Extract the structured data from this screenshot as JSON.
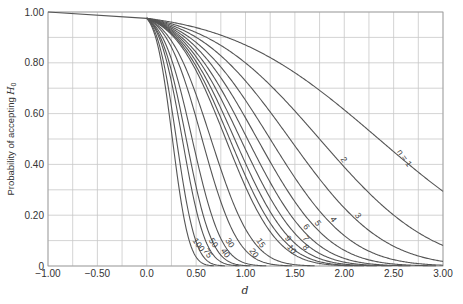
{
  "chart_data": {
    "type": "line",
    "title": "",
    "xlabel": "d",
    "ylabel": "Probability of accepting H0",
    "xlim": [
      -1.0,
      3.0
    ],
    "ylim": [
      0,
      1.0
    ],
    "grid": true,
    "x_ticks": [
      "-1.00",
      "-0.50",
      "0.0",
      "0.50",
      "1.00",
      "1.50",
      "2.00",
      "2.50",
      "3.00"
    ],
    "y_ticks": [
      "0",
      "0.20",
      "0.40",
      "0.60",
      "0.80",
      "1.00"
    ],
    "x_minor_step": 0.25,
    "y_minor_step": 0.1,
    "common_segment": {
      "x": [
        -1.0,
        0.0
      ],
      "y": [
        1.0,
        0.975
      ]
    },
    "x": [
      0,
      0.5,
      1.0,
      1.5,
      2.0,
      2.5,
      3.0
    ],
    "series": [
      {
        "name": "n = 1",
        "label": "n = 1",
        "d50": 2.35,
        "values": [
          0.975,
          0.94,
          0.86,
          0.76,
          0.63,
          0.47,
          0.25
        ]
      },
      {
        "name": "n = 2",
        "label": "2",
        "d50": 1.75,
        "values": [
          0.975,
          0.9,
          0.76,
          0.57,
          0.35,
          0.15,
          0.035
        ]
      },
      {
        "name": "n = 3",
        "label": "3",
        "d50": 1.45,
        "values": [
          0.975,
          0.87,
          0.67,
          0.45,
          0.21,
          0.07,
          0.01
        ]
      },
      {
        "name": "n = 4",
        "label": "4",
        "d50": 1.25,
        "values": [
          0.975,
          0.85,
          0.6,
          0.32,
          0.11,
          0.02,
          0.0
        ]
      },
      {
        "name": "n = 5",
        "label": "5",
        "d50": 1.12,
        "values": [
          0.975,
          0.82,
          0.54,
          0.24,
          0.06,
          0.01,
          0.0
        ]
      },
      {
        "name": "n = 6",
        "label": "6",
        "d50": 1.02,
        "values": [
          0.975,
          0.79,
          0.49,
          0.18,
          0.03,
          0.0,
          0.0
        ]
      },
      {
        "name": "n = 7",
        "label": "7",
        "d50": 0.95,
        "values": [
          0.975,
          0.77,
          0.45,
          0.14,
          0.02,
          0.0,
          0.0
        ]
      },
      {
        "name": "n = 8",
        "label": "8",
        "d50": 0.89,
        "values": [
          0.975,
          0.75,
          0.41,
          0.11,
          0.01,
          0.0,
          0.0
        ]
      },
      {
        "name": "n = 9",
        "label": "9",
        "d50": 0.84,
        "values": [
          0.975,
          0.73,
          0.38,
          0.08,
          0.01,
          0.0,
          0.0
        ]
      },
      {
        "name": "n = 10",
        "label": "10",
        "d50": 0.8,
        "values": [
          0.975,
          0.71,
          0.35,
          0.07,
          0.0,
          0.0,
          0.0
        ]
      },
      {
        "name": "n = 15",
        "label": "15",
        "d50": 0.65,
        "values": [
          0.975,
          0.62,
          0.23,
          0.03,
          0.0,
          0.0,
          0.0
        ]
      },
      {
        "name": "n = 20",
        "label": "20",
        "d50": 0.56,
        "values": [
          0.975,
          0.55,
          0.15,
          0.01,
          0.0,
          0.0,
          0.0
        ]
      },
      {
        "name": "n = 30",
        "label": "30",
        "d50": 0.46,
        "values": [
          0.975,
          0.45,
          0.07,
          0.0,
          0.0,
          0.0,
          0.0
        ]
      },
      {
        "name": "n = 40",
        "label": "40",
        "d50": 0.4,
        "values": [
          0.975,
          0.37,
          0.04,
          0.0,
          0.0,
          0.0,
          0.0
        ]
      },
      {
        "name": "n = 50",
        "label": "50",
        "d50": 0.36,
        "values": [
          0.975,
          0.31,
          0.02,
          0.0,
          0.0,
          0.0,
          0.0
        ]
      },
      {
        "name": "n = 75",
        "label": "75",
        "d50": 0.3,
        "values": [
          0.975,
          0.2,
          0.01,
          0.0,
          0.0,
          0.0,
          0.0
        ]
      },
      {
        "name": "n = 100",
        "label": "100",
        "d50": 0.26,
        "values": [
          0.975,
          0.13,
          0.0,
          0.0,
          0.0,
          0.0,
          0.0
        ]
      }
    ]
  },
  "styles": {
    "curve_color": "#555555",
    "grid_color": "#c8c8c8",
    "axis_color": "#999999",
    "text_color": "#333333"
  }
}
